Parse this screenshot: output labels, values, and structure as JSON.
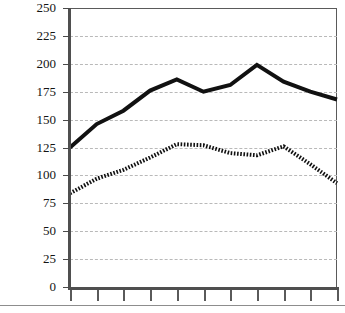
{
  "chart_data": {
    "type": "line",
    "title": "",
    "xlabel": "",
    "ylabel": "",
    "ylim": [
      0,
      250
    ],
    "ytick_labels": [
      "250",
      "225",
      "200",
      "175",
      "150",
      "125",
      "100",
      "75",
      "50",
      "25",
      "0"
    ],
    "ytick_values": [
      250,
      225,
      200,
      175,
      150,
      125,
      100,
      75,
      50,
      25,
      0
    ],
    "grid": true,
    "grid_style": "dashed",
    "legend": "none",
    "x": [
      0,
      1,
      2,
      3,
      4,
      5,
      6,
      7,
      8,
      9,
      10
    ],
    "xtick_count": 11,
    "xtick_labels": [
      "",
      "",
      "",
      "",
      "",
      "",
      "",
      "",
      "",
      "",
      ""
    ],
    "series": [
      {
        "name": "solid-series",
        "style": "solid",
        "color": "#111111",
        "width": 4,
        "values": [
          125,
          146,
          158,
          176,
          186,
          175,
          181,
          199,
          184,
          175,
          168
        ]
      },
      {
        "name": "dashed-series",
        "style": "dashed",
        "color": "#111111",
        "width": 4,
        "values": [
          84,
          97,
          105,
          116,
          128,
          127,
          120,
          118,
          126,
          110,
          93
        ]
      }
    ]
  },
  "axis": {
    "y_axis_color": "#4f4f4f",
    "x_axis_color": "#4f4f4f",
    "grid_color": "#b9b9b9",
    "frame_color": "#5a5a5a"
  }
}
